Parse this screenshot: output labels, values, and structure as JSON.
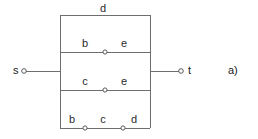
{
  "figure": {
    "caption": "a)",
    "caption_x": 228,
    "caption_y": 68
  },
  "colors": {
    "line": "#6e6e6e",
    "node_stroke": "#5a5a5a",
    "node_fill": "#ffffff",
    "text": "#2b2b2b",
    "background": "#ffffff"
  },
  "terminals": [
    {
      "id": "s",
      "label": "s",
      "label_x": 14,
      "label_y": 66,
      "node_x": 24,
      "node_y": 71
    },
    {
      "id": "t",
      "label": "t",
      "label_x": 188,
      "label_y": 66,
      "node_x": 181,
      "node_y": 71
    }
  ],
  "nodes": [
    {
      "id": "n-top-mid",
      "x": 105,
      "y": 52
    },
    {
      "id": "n-mid-mid",
      "x": 105,
      "y": 90
    },
    {
      "id": "n-bottom-left",
      "x": 85,
      "y": 128
    },
    {
      "id": "n-bottom-right",
      "x": 123,
      "y": 128
    }
  ],
  "edges": [
    {
      "id": "edge-top-d",
      "label": "d",
      "label_x": 103,
      "label_y": 4,
      "path": "top-branch"
    },
    {
      "id": "edge-upper-b",
      "label": "b",
      "label_x": 85,
      "label_y": 38,
      "path": "upper-left"
    },
    {
      "id": "edge-upper-e",
      "label": "e",
      "label_x": 124,
      "label_y": 38,
      "path": "upper-right"
    },
    {
      "id": "edge-middle-c",
      "label": "c",
      "label_x": 85,
      "label_y": 76,
      "path": "middle-left"
    },
    {
      "id": "edge-middle-e",
      "label": "e",
      "label_x": 124,
      "label_y": 76,
      "path": "middle-right"
    },
    {
      "id": "edge-bottom-b",
      "label": "b",
      "label_x": 72,
      "label_y": 115,
      "path": "bottom-left"
    },
    {
      "id": "edge-bottom-c",
      "label": "c",
      "label_x": 103,
      "label_y": 115,
      "path": "bottom-middle"
    },
    {
      "id": "edge-bottom-d",
      "label": "d",
      "label_x": 134,
      "label_y": 115,
      "path": "bottom-right"
    }
  ],
  "geometry": {
    "rect_left": 60,
    "rect_right": 150,
    "rect_top": 15,
    "rect_bottom": 128,
    "line_upper_y": 52,
    "line_middle_y": 90,
    "lead_y": 71,
    "lead_s_start": 26,
    "lead_t_end": 179,
    "node_radius": 2.1,
    "terminal_radius": 2.3,
    "stroke_width": 1
  }
}
